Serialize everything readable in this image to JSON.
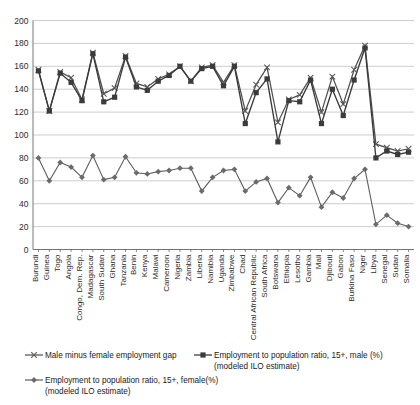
{
  "chart_data": {
    "type": "line",
    "title": "",
    "xlabel": "",
    "ylabel": "",
    "ylim": [
      0,
      200
    ],
    "ytick_step": 20,
    "grid": true,
    "legend_position": "bottom",
    "yticks": [
      "0",
      "20",
      "40",
      "60",
      "80",
      "100",
      "120",
      "140",
      "160",
      "180",
      "200"
    ],
    "categories": [
      "Burundi",
      "Guinea",
      "Togo",
      "Angola",
      "Congo, Dem. Rep.",
      "Madagascar",
      "South Sudan",
      "Ghana",
      "Tanzania",
      "Benin",
      "Kenya",
      "Malawi",
      "Cameroon",
      "Nigeria",
      "Zambia",
      "Liberia",
      "Namibia",
      "Uganda",
      "Zimbabwe",
      "Chad",
      "Central African Republic",
      "South Africa",
      "Botswana",
      "Ethiopia",
      "Lesotho",
      "Gambia",
      "Mali",
      "Djibouti",
      "Gabon",
      "Burkina Faso",
      "Niger",
      "Libya",
      "Senegal",
      "Sudan",
      "Somalia"
    ],
    "series": [
      {
        "name": "Male minus female employment gap",
        "marker": "cross",
        "color": "#5a5a5a",
        "values": [
          157,
          121,
          155,
          150,
          131,
          172,
          136,
          141,
          169,
          145,
          142,
          149,
          153,
          160,
          147,
          159,
          161,
          146,
          161,
          121,
          144,
          159,
          111,
          131,
          135,
          150,
          120,
          151,
          127,
          157,
          178,
          92,
          89,
          86,
          88
        ]
      },
      {
        "name": "Employment to population ratio, 15+, male (%) (modeled ILO estimate)",
        "marker": "square",
        "color": "#3b3b3b",
        "values": [
          156,
          121,
          154,
          146,
          130,
          171,
          129,
          133,
          168,
          142,
          139,
          147,
          152,
          160,
          147,
          158,
          160,
          143,
          160,
          110,
          137,
          149,
          94,
          130,
          129,
          148,
          110,
          140,
          117,
          148,
          176,
          80,
          86,
          83,
          85
        ]
      },
      {
        "name": "Employment to population ratio, 15+, female(%) (modeled ILO estimate)",
        "marker": "diamond",
        "color": "#6a6a6a",
        "values": [
          80,
          60,
          76,
          72,
          63,
          82,
          61,
          63,
          81,
          67,
          66,
          68,
          69,
          71,
          71,
          51,
          63,
          69,
          70,
          51,
          59,
          62,
          41,
          54,
          47,
          63,
          37,
          50,
          45,
          62,
          70,
          22,
          30,
          23,
          20
        ]
      }
    ]
  },
  "legend": {
    "items": [
      {
        "label": "Male minus female employment gap",
        "marker": "cross-marker"
      },
      {
        "label": "Employment to population ratio, 15+, male (%)",
        "label2": "(modeled ILO estimate)",
        "marker": "square-marker"
      },
      {
        "label": "Employment to population ratio, 15+, female(%)",
        "label2": "(modeled ILO estimate)",
        "marker": "diamond-marker"
      }
    ]
  }
}
